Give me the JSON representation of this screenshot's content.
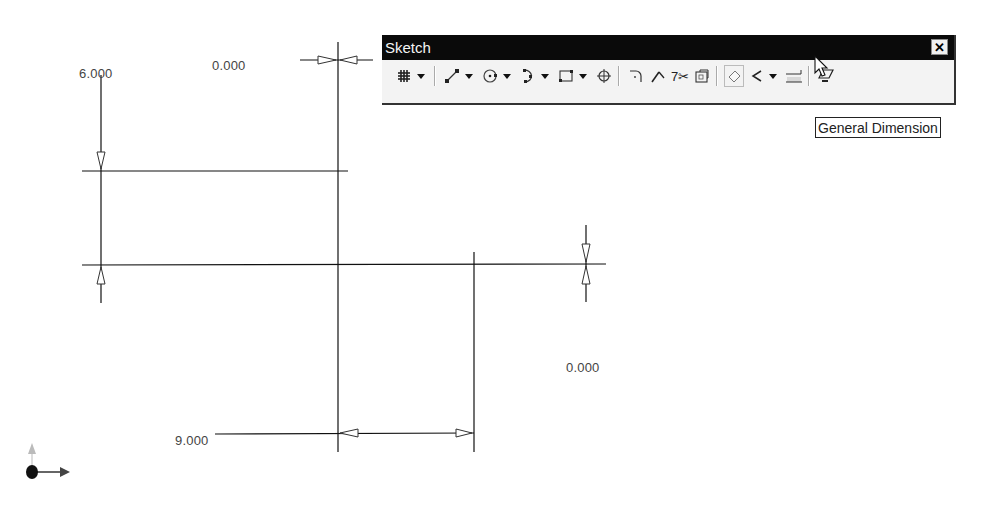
{
  "toolbar": {
    "title": "Sketch",
    "close_label": "✕",
    "buttons": [
      {
        "name": "grid",
        "icon": "grid-icon",
        "glyph": "#",
        "dropdown": true
      },
      {
        "name": "line",
        "icon": "line-icon",
        "glyph": "⟋",
        "dropdown": true
      },
      {
        "name": "circle",
        "icon": "circle-icon",
        "glyph": "⊙",
        "dropdown": true
      },
      {
        "name": "arc",
        "icon": "arc-icon",
        "glyph": ")",
        "dropdown": true
      },
      {
        "name": "rectangle",
        "icon": "rectangle-icon",
        "glyph": "▭",
        "dropdown": true
      },
      {
        "name": "point",
        "icon": "point-icon",
        "glyph": "⌖",
        "dropdown": false
      },
      {
        "name": "fillet",
        "icon": "fillet-icon",
        "glyph": "⌝",
        "dropdown": false
      },
      {
        "name": "extend",
        "icon": "extend-icon",
        "glyph": "↗",
        "dropdown": false
      },
      {
        "name": "trim",
        "icon": "trim-icon",
        "glyph": "✂",
        "dropdown": false
      },
      {
        "name": "offset",
        "icon": "offset-icon",
        "glyph": "⧉",
        "dropdown": false
      },
      {
        "name": "general-dimension",
        "icon": "dimension-icon",
        "glyph": "◇",
        "dropdown": false,
        "active": true
      },
      {
        "name": "constraint",
        "icon": "check-icon",
        "glyph": "✓",
        "dropdown": true
      },
      {
        "name": "text",
        "icon": "text-icon",
        "glyph": "T",
        "dropdown": false
      },
      {
        "name": "project",
        "icon": "project-icon",
        "glyph": "▱",
        "dropdown": false
      }
    ]
  },
  "tooltip": {
    "text": "General Dimension"
  },
  "dimensions": {
    "vertical_left": "6.000",
    "horizontal_top": "0.000",
    "vertical_right": "0.000",
    "horizontal_bottom": "9.000"
  }
}
